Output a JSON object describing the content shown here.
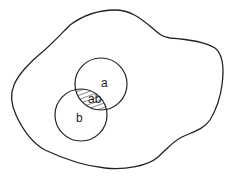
{
  "diagram": {
    "type": "venn",
    "universe": {
      "label": ""
    },
    "sets": [
      {
        "id": "a",
        "label": "a"
      },
      {
        "id": "b",
        "label": "b"
      }
    ],
    "intersection": {
      "label": "ab",
      "fill": "hatched"
    },
    "colors": {
      "stroke": "#222222",
      "background": "#ffffff"
    }
  }
}
